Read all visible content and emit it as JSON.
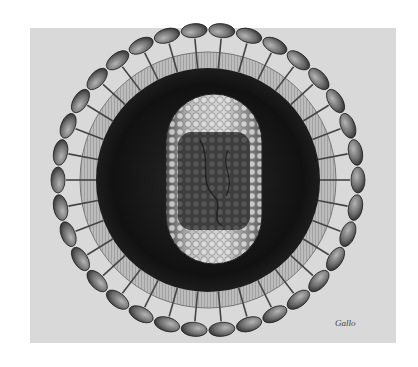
{
  "illustration": {
    "subject": "virus particle cross-section",
    "signature": "Gallo",
    "colors": {
      "background": "#ffffff",
      "panel": "#d9d9d9",
      "envelope_dark": "#1a1a1a",
      "capsid_light": "#cfcfcf",
      "core_dark": "#4a4a4a",
      "spike_head": "#7a7a7a"
    },
    "layout": {
      "center": [
        208,
        180
      ],
      "spike_ring_radius": 150,
      "membrane_outer_radius": 128,
      "membrane_inner_radius": 112,
      "spike_count": 34
    }
  }
}
